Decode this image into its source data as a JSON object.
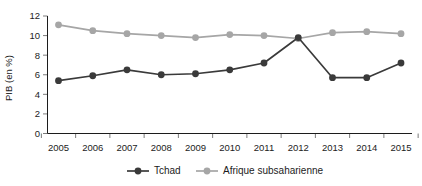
{
  "chart_data": {
    "type": "line",
    "title": "",
    "xlabel": "",
    "ylabel": "PIB (en %)",
    "categories": [
      "2005",
      "2006",
      "2007",
      "2008",
      "2009",
      "2010",
      "2011",
      "2012",
      "2013",
      "2014",
      "2015"
    ],
    "x": [
      2005,
      2006,
      2007,
      2008,
      2009,
      2010,
      2011,
      2012,
      2013,
      2014,
      2015
    ],
    "xlim": [
      2005,
      2015
    ],
    "ylim": [
      0,
      12
    ],
    "yticks": [
      0,
      2,
      4,
      6,
      8,
      10,
      12
    ],
    "ytick_labels": [
      "0",
      "2",
      "4",
      "6",
      "8",
      "10",
      "12"
    ],
    "grid": false,
    "legend_position": "bottom",
    "series": [
      {
        "name": "Tchad",
        "color": "#3a3a3a",
        "marker": "circle",
        "values": [
          5.4,
          5.9,
          6.5,
          6.0,
          6.1,
          6.5,
          7.2,
          9.8,
          5.7,
          5.7,
          7.2
        ]
      },
      {
        "name": "Afrique subsaharienne",
        "color": "#a6a6a6",
        "marker": "circle",
        "values": [
          11.1,
          10.5,
          10.2,
          10.0,
          9.8,
          10.1,
          10.0,
          9.7,
          10.3,
          10.4,
          10.2
        ]
      }
    ]
  },
  "legend": {
    "items": [
      {
        "label": "Tchad",
        "color": "#3a3a3a"
      },
      {
        "label": "Afrique subsaharienne",
        "color": "#a6a6a6"
      }
    ]
  },
  "axes": {
    "y_axis_title": "PIB (en %)"
  }
}
